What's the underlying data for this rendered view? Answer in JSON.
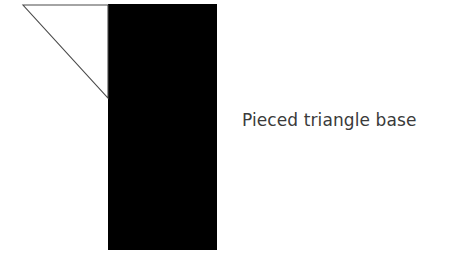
{
  "figure": {
    "width": 462,
    "height": 267,
    "background_color": "#ffffff",
    "caption": "Pieced triangle base"
  },
  "shapes": {
    "base_rectangle": {
      "name": "black-rectangle",
      "fill_color": "#000000",
      "x": 108,
      "y": 4,
      "width": 109,
      "height": 246
    },
    "pieced_triangle": {
      "name": "triangle-outline",
      "fill_color": "#ffffff",
      "stroke_color": "#4a4a4a",
      "stroke_width": 1,
      "points": "23,5 108,5 108,98",
      "apex": {
        "x": 23,
        "y": 5
      },
      "top_right": {
        "x": 108,
        "y": 5
      },
      "bottom_right": {
        "x": 108,
        "y": 98
      }
    }
  }
}
